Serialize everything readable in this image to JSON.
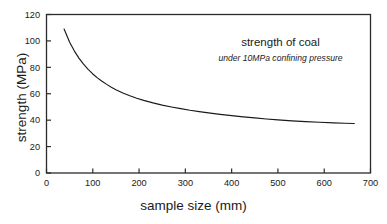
{
  "chart_data": {
    "type": "line",
    "title": "",
    "xlabel": "sample size (mm)",
    "ylabel": "strength (MPa)",
    "xlim": [
      0,
      700
    ],
    "ylim": [
      0,
      120
    ],
    "xticks": [
      0,
      100,
      200,
      300,
      400,
      500,
      600,
      700
    ],
    "yticks": [
      0,
      20,
      40,
      60,
      80,
      100,
      120
    ],
    "grid": false,
    "legend": null,
    "line_color": "#1a1a1a",
    "annotations": {
      "title": "strength of coal",
      "subtitle": "under 10MPa confining pressure"
    },
    "series": [
      {
        "name": "strength of coal under 10MPa confining pressure",
        "x": [
          38,
          50,
          60,
          70,
          80,
          90,
          100,
          110,
          120,
          130,
          140,
          150,
          165,
          180,
          195,
          210,
          230,
          250,
          270,
          290,
          310,
          330,
          350,
          375,
          400,
          425,
          450,
          475,
          500,
          530,
          560,
          590,
          620,
          645,
          665
        ],
        "y": [
          109.0,
          99.0,
          92.5,
          87.0,
          82.5,
          78.5,
          75.0,
          72.0,
          69.4,
          67.1,
          65.0,
          63.1,
          60.6,
          58.5,
          56.6,
          55.0,
          53.1,
          51.4,
          50.0,
          48.7,
          47.5,
          46.5,
          45.5,
          44.4,
          43.4,
          42.5,
          41.7,
          40.9,
          40.2,
          39.5,
          38.9,
          38.4,
          38.0,
          37.7,
          37.5
        ]
      }
    ]
  },
  "axes": {
    "x_title": "sample size (mm)",
    "y_title": "strength (MPa)",
    "x_tick_labels": [
      "0",
      "100",
      "200",
      "300",
      "400",
      "500",
      "600",
      "700"
    ],
    "y_tick_labels": [
      "0",
      "20",
      "40",
      "60",
      "80",
      "100",
      "120"
    ]
  },
  "annotation": {
    "title": "strength of coal",
    "subtitle": "under 10MPa confining pressure"
  }
}
